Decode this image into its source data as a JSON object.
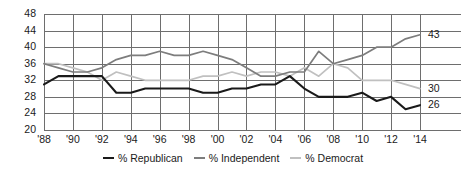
{
  "chart_data": {
    "type": "line",
    "title": "",
    "xlabel": "",
    "ylabel": "",
    "ylim": [
      20,
      48
    ],
    "ytick_values": [
      20,
      24,
      28,
      32,
      36,
      40,
      44,
      48
    ],
    "ytick_labels": [
      "20",
      "24",
      "28",
      "32",
      "36",
      "40",
      "44",
      "48"
    ],
    "grid": true,
    "legend_position": "bottom-center",
    "x": [
      1988,
      1989,
      1990,
      1991,
      1992,
      1993,
      1994,
      1995,
      1996,
      1997,
      1998,
      1999,
      2000,
      2001,
      2002,
      2003,
      2004,
      2005,
      2006,
      2007,
      2008,
      2009,
      2010,
      2011,
      2012,
      2013,
      2014
    ],
    "xtick_values": [
      1988,
      1990,
      1992,
      1994,
      1996,
      1998,
      2000,
      2002,
      2004,
      2006,
      2008,
      2010,
      2012,
      2014
    ],
    "xtick_labels": [
      "'88",
      "'90",
      "'92",
      "'94",
      "'96",
      "'98",
      "'00",
      "'02",
      "'04",
      "'06",
      "'08",
      "'10",
      "'12",
      "'14"
    ],
    "series": [
      {
        "name": "% Republican",
        "color": "#1a1a1a",
        "end_label": "26",
        "values": [
          31,
          33,
          33,
          33,
          33,
          29,
          29,
          30,
          30,
          30,
          30,
          29,
          29,
          30,
          30,
          31,
          31,
          33,
          30,
          28,
          28,
          28,
          29,
          27,
          28,
          25,
          26
        ]
      },
      {
        "name": "% Independent",
        "color": "#7d7d7d",
        "end_label": "43",
        "values": [
          36,
          35,
          34,
          34,
          35,
          37,
          38,
          38,
          39,
          38,
          38,
          39,
          38,
          37,
          35,
          33,
          33,
          34,
          34,
          39,
          36,
          37,
          38,
          40,
          40,
          42,
          43
        ]
      },
      {
        "name": "% Democrat",
        "color": "#c0c0c0",
        "end_label": "30",
        "values": [
          36,
          36,
          35,
          34,
          32,
          34,
          33,
          32,
          32,
          32,
          32,
          33,
          33,
          34,
          33,
          34,
          34,
          33,
          35,
          33,
          36,
          35,
          32,
          32,
          32,
          31,
          30
        ]
      }
    ]
  },
  "legend": {
    "items": [
      {
        "label": "% Republican",
        "color": "#1a1a1a"
      },
      {
        "label": "% Independent",
        "color": "#7d7d7d"
      },
      {
        "label": "% Democrat",
        "color": "#c0c0c0"
      }
    ]
  },
  "style": {
    "grid_color": "#6e6e6e",
    "background": "#ffffff",
    "text_color": "#1a1a1a"
  }
}
